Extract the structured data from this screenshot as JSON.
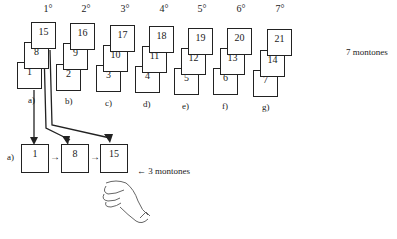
{
  "stacks": [
    {
      "ordinal": "1°",
      "label": "a)",
      "cards": [
        "1",
        "8",
        "15"
      ]
    },
    {
      "ordinal": "2°",
      "label": "b)",
      "cards": [
        "2",
        "9",
        "16"
      ]
    },
    {
      "ordinal": "3°",
      "label": "c)",
      "cards": [
        "3",
        "10",
        "17"
      ]
    },
    {
      "ordinal": "4°",
      "label": "d)",
      "cards": [
        "4",
        "11",
        "18"
      ]
    },
    {
      "ordinal": "5°",
      "label": "e)",
      "cards": [
        "5",
        "12",
        "19"
      ]
    },
    {
      "ordinal": "6°",
      "label": "f)",
      "cards": [
        "6",
        "13",
        "20"
      ]
    },
    {
      "ordinal": "7°",
      "label": "g)",
      "cards": [
        "7",
        "14",
        "21"
      ]
    }
  ],
  "right_note": "7 montones",
  "sequence": {
    "label": "a)",
    "cards": [
      "1",
      "8",
      "15"
    ],
    "arrow": "→",
    "note": "← 3 montones"
  }
}
